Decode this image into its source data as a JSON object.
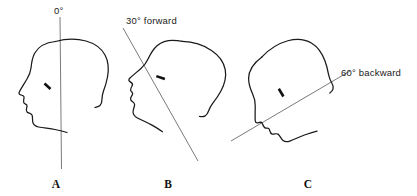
{
  "figure": {
    "background_color": "#ffffff",
    "ink_color": "#1a1a1a",
    "axis_color": "#6b6b6b",
    "width": 417,
    "height": 196
  },
  "panels": [
    {
      "id": "A",
      "letter": "A",
      "angle_label": "0°",
      "angle_degrees": 0,
      "direction": "neutral",
      "axis_orientation": "vertical",
      "facing": "left"
    },
    {
      "id": "B",
      "letter": "B",
      "angle_label": "30° forward",
      "angle_degrees": 30,
      "direction": "forward",
      "axis_orientation": "tilted-forward",
      "facing": "left"
    },
    {
      "id": "C",
      "letter": "C",
      "angle_label": "60° backward",
      "angle_degrees": 60,
      "direction": "backward",
      "axis_orientation": "tilted-backward",
      "facing": "left"
    }
  ]
}
